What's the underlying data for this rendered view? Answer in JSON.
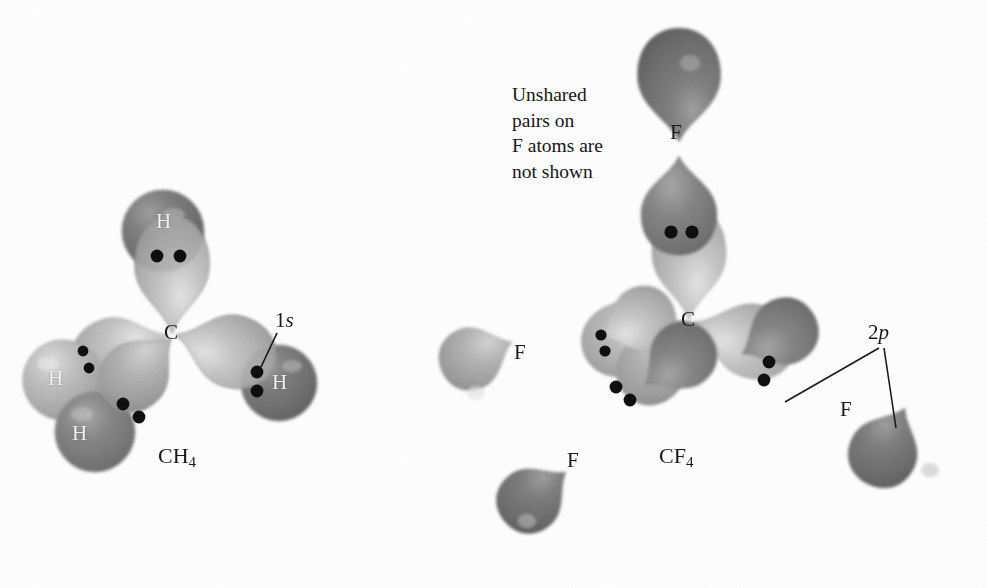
{
  "figure": {
    "background_color": "#fefefe",
    "ink_color": "#141414"
  },
  "palette": {
    "hybrid_lobe_light": "#b9b9b9",
    "hybrid_lobe_mid": "#a6a6a6",
    "sphere_dark": "#6f6f6f",
    "sphere_light": "#b0b0b0",
    "p_lobe_dark": "#6a6a6a",
    "p_lobe_mid": "#8d8d8d",
    "electron_dot": "#0b0b0b",
    "outline": "#9a9a9a",
    "label_light": "#f4f4f4",
    "label_dark": "#151515"
  },
  "molecules": [
    {
      "id": "ch4",
      "formula_text": "CH",
      "formula_sub": "4",
      "formula_position": {
        "x": 158,
        "y": 446
      },
      "central_atom": {
        "symbol": "C",
        "x": 172,
        "y": 333
      },
      "orbital_callout": {
        "text_prefix": "1",
        "text_italic": "s",
        "x": 283,
        "y": 320
      },
      "ligands": [
        {
          "symbol": "H",
          "x": 163,
          "y": 222,
          "shade": "dark",
          "label_color": "light",
          "electron_pair": 2
        },
        {
          "symbol": "H",
          "x": 55,
          "y": 379,
          "shade": "light",
          "label_color": "light",
          "electron_pair": 2
        },
        {
          "symbol": "H",
          "x": 79,
          "y": 434,
          "shade": "dark",
          "label_color": "light",
          "electron_pair": 2
        },
        {
          "symbol": "H",
          "x": 270,
          "y": 394,
          "shade": "dark",
          "label_color": "light",
          "electron_pair": 2
        }
      ]
    },
    {
      "id": "cf4",
      "formula_text": "CF",
      "formula_sub": "4",
      "formula_position": {
        "x": 659,
        "y": 446
      },
      "central_atom": {
        "symbol": "C",
        "x": 689,
        "y": 320
      },
      "orbital_callout": {
        "text_prefix": "2",
        "text_italic": "p",
        "x": 875,
        "y": 330
      },
      "note": "Unshared\npairs on\nF atoms are\nnot shown",
      "note_position": {
        "x": 512,
        "y": 88
      },
      "ligands": [
        {
          "symbol": "F",
          "x": 676,
          "y": 130,
          "shade": "dark",
          "label_color": "dark",
          "electron_pair": 2
        },
        {
          "symbol": "F",
          "x": 521,
          "y": 352,
          "shade": "mid",
          "label_color": "dark",
          "electron_pair": 2
        },
        {
          "symbol": "F",
          "x": 574,
          "y": 460,
          "shade": "dark",
          "label_color": "dark",
          "electron_pair": 2
        },
        {
          "symbol": "F",
          "x": 846,
          "y": 409,
          "shade": "dark",
          "label_color": "dark",
          "electron_pair": 2
        }
      ]
    }
  ],
  "electron_pairs": {
    "count_per_bond": 2,
    "meaning": "shared bonding electron pair",
    "ch4_positions": [
      {
        "x": 157,
        "y": 255
      },
      {
        "x": 178,
        "y": 255
      },
      {
        "x": 79,
        "y": 351
      },
      {
        "x": 85,
        "y": 367
      },
      {
        "x": 121,
        "y": 402
      },
      {
        "x": 136,
        "y": 414
      },
      {
        "x": 256,
        "y": 373
      },
      {
        "x": 256,
        "y": 391
      }
    ],
    "cf4_positions": [
      {
        "x": 670,
        "y": 232
      },
      {
        "x": 690,
        "y": 232
      },
      {
        "x": 602,
        "y": 334
      },
      {
        "x": 606,
        "y": 349
      },
      {
        "x": 615,
        "y": 386
      },
      {
        "x": 628,
        "y": 398
      },
      {
        "x": 768,
        "y": 362
      },
      {
        "x": 763,
        "y": 379
      }
    ]
  }
}
